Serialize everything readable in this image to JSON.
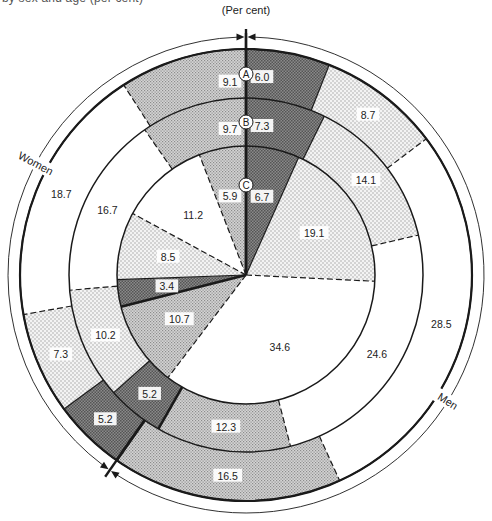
{
  "caption_partial": "by sex and age (per cent)",
  "chart_data": {
    "type": "pie",
    "subtype": "concentric-rings",
    "title": "",
    "unit_label": "(Per cent)",
    "ring_order_outer_to_inner": [
      "A",
      "B",
      "C"
    ],
    "gender_labels": {
      "women": "Women",
      "men": "Men"
    },
    "direction": "clockwise from top",
    "categories": [
      {
        "group": "Men",
        "pattern": "dark"
      },
      {
        "group": "Men",
        "pattern": "light-dot"
      },
      {
        "group": "Men",
        "pattern": "white"
      },
      {
        "group": "Men",
        "pattern": "medium-dot"
      },
      {
        "group": "Women",
        "pattern": "dark"
      },
      {
        "group": "Women",
        "pattern": "light-dot"
      },
      {
        "group": "Women",
        "pattern": "white"
      },
      {
        "group": "Women",
        "pattern": "medium-dot"
      }
    ],
    "series": [
      {
        "name": "A",
        "values": [
          6.0,
          8.7,
          28.5,
          16.5,
          5.2,
          7.3,
          18.7,
          9.1
        ]
      },
      {
        "name": "B",
        "values": [
          7.3,
          14.1,
          24.6,
          12.3,
          5.2,
          10.2,
          16.7,
          9.7
        ]
      },
      {
        "name": "C",
        "values": [
          6.7,
          19.1,
          34.6,
          10.7,
          3.4,
          8.5,
          11.2,
          5.9
        ]
      }
    ],
    "colors": {
      "dark": "#6f6f6f",
      "medium-dot": "#bdbdbd",
      "light-dot": "#e6e6e6",
      "white": "#ffffff",
      "line": "#1a1a1a"
    }
  }
}
